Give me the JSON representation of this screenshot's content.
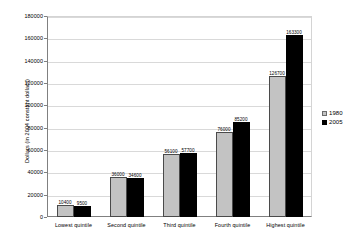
{
  "chart_data": {
    "type": "bar",
    "title": "",
    "subtitle": "",
    "xlabel": "",
    "ylabel": "Dollars (in 2004 constant dollars)",
    "ylim": [
      0,
      180000
    ],
    "ytick_step": 20000,
    "yticks": [
      0,
      20000,
      40000,
      60000,
      80000,
      100000,
      120000,
      140000,
      160000,
      180000
    ],
    "ytick_labels": [
      "0",
      "20000",
      "40000",
      "60000",
      "80000",
      "100000",
      "120000",
      "140000",
      "160000",
      "180000"
    ],
    "grid": true,
    "grid_axis": "y",
    "legend_position": "right",
    "categories": [
      "Lowest quintile",
      "Second quintile",
      "Third quintile",
      "Fourth quintile",
      "Highest quintile"
    ],
    "series": [
      {
        "name": "1980",
        "color": "#c3c3c3",
        "values": [
          10400,
          36000,
          56100,
          76000,
          126700
        ],
        "value_labels": [
          "10400",
          "36000",
          "56100",
          "76000",
          "126700"
        ]
      },
      {
        "name": "2005",
        "color": "#000000",
        "values": [
          9500,
          34600,
          57700,
          85200,
          163300
        ],
        "value_labels": [
          "9500",
          "34600",
          "57700",
          "85200",
          "163300"
        ]
      }
    ]
  },
  "legend": {
    "items": [
      {
        "label": "1980",
        "swatch": "legend-swatch-1980"
      },
      {
        "label": "2005",
        "swatch": "legend-swatch-2005"
      }
    ]
  }
}
